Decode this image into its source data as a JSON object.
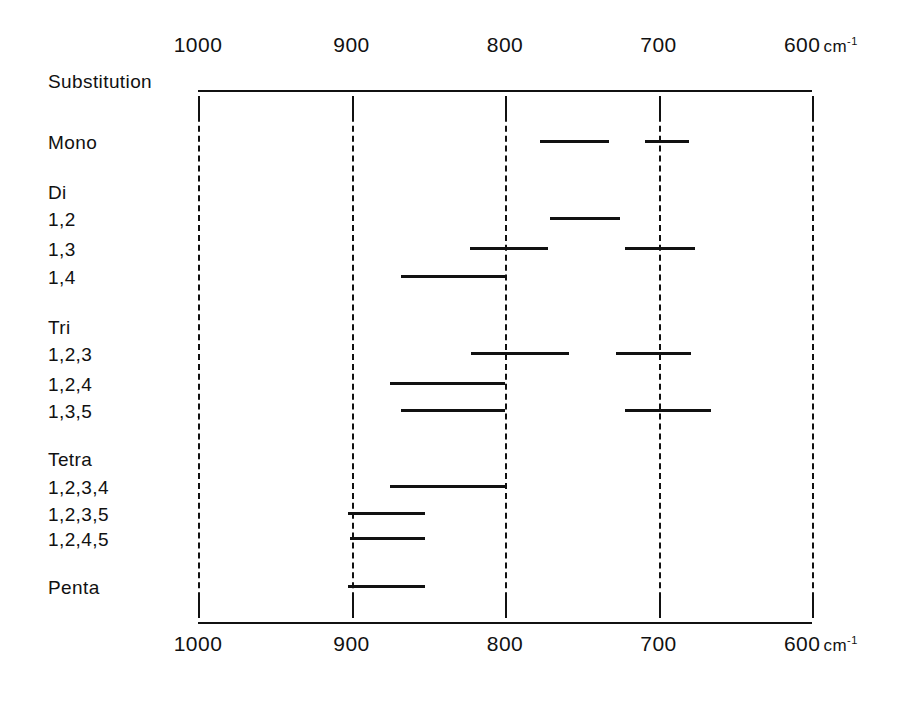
{
  "figure": {
    "title_label": "Substitution",
    "unit_label": "cm",
    "unit_exponent": "-1"
  },
  "chart_data": {
    "type": "bar",
    "orientation": "horizontal-range",
    "title": "Substitution",
    "xlabel": "cm-1",
    "ylabel": "Substitution",
    "xlim": [
      1000,
      600
    ],
    "x_inverted": true,
    "grid": true,
    "legend": "none",
    "axis_ticks": [
      1000,
      900,
      800,
      700,
      600
    ],
    "axis_tick_labels": [
      "1000",
      "900",
      "800",
      "700",
      "600"
    ],
    "top_axis": true,
    "bottom_axis": true,
    "categories": [
      "Mono",
      "Di",
      "1,2",
      "1,3",
      "1,4",
      "Tri",
      "1,2,3",
      "1,2,4",
      "1,3,5",
      "Tetra",
      "1,2,3,4",
      "1,2,3,5",
      "1,2,4,5",
      "Penta"
    ],
    "rows": [
      {
        "label": "Mono",
        "is_group_header": false,
        "bands": [
          {
            "from": 777,
            "to": 732
          },
          {
            "from": 709,
            "to": 680
          }
        ]
      },
      {
        "label": "Di",
        "is_group_header": true,
        "bands": []
      },
      {
        "label": "1,2",
        "is_group_header": false,
        "bands": [
          {
            "from": 771,
            "to": 725
          }
        ]
      },
      {
        "label": "1,3",
        "is_group_header": false,
        "bands": [
          {
            "from": 823,
            "to": 772
          },
          {
            "from": 722,
            "to": 676
          }
        ]
      },
      {
        "label": "1,4",
        "is_group_header": false,
        "bands": [
          {
            "from": 868,
            "to": 800
          }
        ]
      },
      {
        "label": "Tri",
        "is_group_header": true,
        "bands": []
      },
      {
        "label": "1,2,3",
        "is_group_header": false,
        "bands": [
          {
            "from": 822,
            "to": 758
          },
          {
            "from": 728,
            "to": 679
          }
        ]
      },
      {
        "label": "1,2,4",
        "is_group_header": false,
        "bands": [
          {
            "from": 875,
            "to": 800
          }
        ]
      },
      {
        "label": "1,3,5",
        "is_group_header": false,
        "bands": [
          {
            "from": 868,
            "to": 800
          },
          {
            "from": 722,
            "to": 666
          }
        ]
      },
      {
        "label": "Tetra",
        "is_group_header": true,
        "bands": []
      },
      {
        "label": "1,2,3,4",
        "is_group_header": false,
        "bands": [
          {
            "from": 875,
            "to": 800
          }
        ]
      },
      {
        "label": "1,2,3,5",
        "is_group_header": false,
        "bands": [
          {
            "from": 902,
            "to": 852
          }
        ]
      },
      {
        "label": "1,2,4,5",
        "is_group_header": false,
        "bands": [
          {
            "from": 901,
            "to": 852
          }
        ]
      },
      {
        "label": "Penta",
        "is_group_header": false,
        "bands": [
          {
            "from": 902,
            "to": 852
          }
        ]
      }
    ]
  },
  "layout": {
    "plot_left_px": 198,
    "plot_right_px": 812,
    "px_per_wavenumber": 1.535,
    "top_rule_y": 90,
    "bottom_rule_y": 622,
    "grid_top_y": 96,
    "grid_bottom_y": 618,
    "row_y": [
      133,
      183,
      210,
      240,
      268,
      318,
      345,
      375,
      402,
      450,
      478,
      505,
      530,
      578
    ],
    "label_x": 48,
    "title_y": 72
  }
}
